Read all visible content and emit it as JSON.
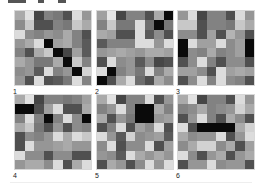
{
  "figure": {
    "panels": [
      {
        "label": "1",
        "cells": [
          [
            170,
            225,
            70,
            130,
            120,
            80,
            220,
            150
          ],
          [
            140,
            200,
            80,
            80,
            130,
            120,
            200,
            170
          ],
          [
            220,
            140,
            130,
            150,
            140,
            170,
            130,
            80
          ],
          [
            150,
            170,
            220,
            10,
            160,
            170,
            130,
            90
          ],
          [
            130,
            80,
            170,
            200,
            10,
            70,
            160,
            90
          ],
          [
            170,
            150,
            120,
            120,
            170,
            10,
            200,
            130
          ],
          [
            140,
            150,
            90,
            220,
            130,
            150,
            10,
            210
          ],
          [
            150,
            80,
            220,
            80,
            90,
            120,
            220,
            130
          ]
        ]
      },
      {
        "label": "2",
        "cells": [
          [
            160,
            230,
            70,
            130,
            130,
            80,
            170,
            10
          ],
          [
            130,
            200,
            120,
            120,
            220,
            110,
            10,
            120
          ],
          [
            170,
            160,
            80,
            80,
            220,
            90,
            140,
            80
          ],
          [
            90,
            130,
            130,
            130,
            220,
            220,
            150,
            220
          ],
          [
            150,
            160,
            170,
            160,
            150,
            170,
            170,
            160
          ],
          [
            80,
            220,
            140,
            150,
            90,
            140,
            70,
            80
          ],
          [
            220,
            10,
            130,
            150,
            120,
            220,
            130,
            170
          ],
          [
            10,
            80,
            170,
            220,
            110,
            80,
            170,
            140
          ]
        ]
      },
      {
        "label": "3",
        "cells": [
          [
            150,
            220,
            70,
            130,
            130,
            80,
            220,
            150
          ],
          [
            200,
            200,
            80,
            130,
            130,
            120,
            200,
            170
          ],
          [
            140,
            140,
            80,
            160,
            80,
            180,
            150,
            80
          ],
          [
            10,
            220,
            160,
            160,
            220,
            140,
            160,
            10
          ],
          [
            10,
            140,
            130,
            170,
            130,
            140,
            160,
            10
          ],
          [
            80,
            140,
            220,
            130,
            80,
            140,
            140,
            80
          ],
          [
            160,
            160,
            140,
            80,
            220,
            160,
            170,
            160
          ],
          [
            80,
            140,
            220,
            130,
            220,
            140,
            130,
            80
          ]
        ]
      },
      {
        "label": "4",
        "cells": [
          [
            170,
            225,
            70,
            130,
            130,
            120,
            130,
            160
          ],
          [
            10,
            10,
            80,
            160,
            220,
            80,
            80,
            170
          ],
          [
            130,
            220,
            130,
            10,
            130,
            220,
            140,
            10
          ],
          [
            170,
            200,
            120,
            80,
            150,
            80,
            140,
            130
          ],
          [
            80,
            140,
            130,
            150,
            220,
            170,
            220,
            200
          ],
          [
            80,
            220,
            150,
            150,
            160,
            170,
            150,
            150
          ],
          [
            220,
            140,
            140,
            80,
            140,
            140,
            80,
            80
          ],
          [
            150,
            170,
            170,
            140,
            220,
            80,
            170,
            220
          ]
        ]
      },
      {
        "label": "5",
        "cells": [
          [
            170,
            225,
            70,
            130,
            130,
            220,
            80,
            150
          ],
          [
            130,
            150,
            220,
            130,
            10,
            10,
            170,
            130
          ],
          [
            170,
            80,
            150,
            120,
            10,
            10,
            150,
            160
          ],
          [
            80,
            130,
            220,
            80,
            160,
            140,
            220,
            80
          ],
          [
            220,
            150,
            90,
            210,
            140,
            150,
            160,
            90
          ],
          [
            140,
            220,
            80,
            140,
            140,
            220,
            80,
            160
          ],
          [
            150,
            140,
            90,
            220,
            170,
            150,
            170,
            150
          ],
          [
            80,
            170,
            150,
            80,
            140,
            220,
            150,
            220
          ]
        ]
      },
      {
        "label": "6",
        "cells": [
          [
            170,
            225,
            70,
            130,
            130,
            80,
            220,
            150
          ],
          [
            130,
            140,
            170,
            130,
            140,
            150,
            210,
            170
          ],
          [
            80,
            150,
            220,
            130,
            80,
            170,
            140,
            80
          ],
          [
            220,
            80,
            10,
            10,
            10,
            10,
            170,
            210
          ],
          [
            170,
            140,
            150,
            150,
            220,
            80,
            150,
            220
          ],
          [
            140,
            170,
            210,
            210,
            140,
            170,
            80,
            160
          ],
          [
            220,
            140,
            80,
            150,
            170,
            80,
            150,
            170
          ],
          [
            80,
            150,
            150,
            220,
            140,
            150,
            150,
            80
          ]
        ]
      }
    ]
  }
}
